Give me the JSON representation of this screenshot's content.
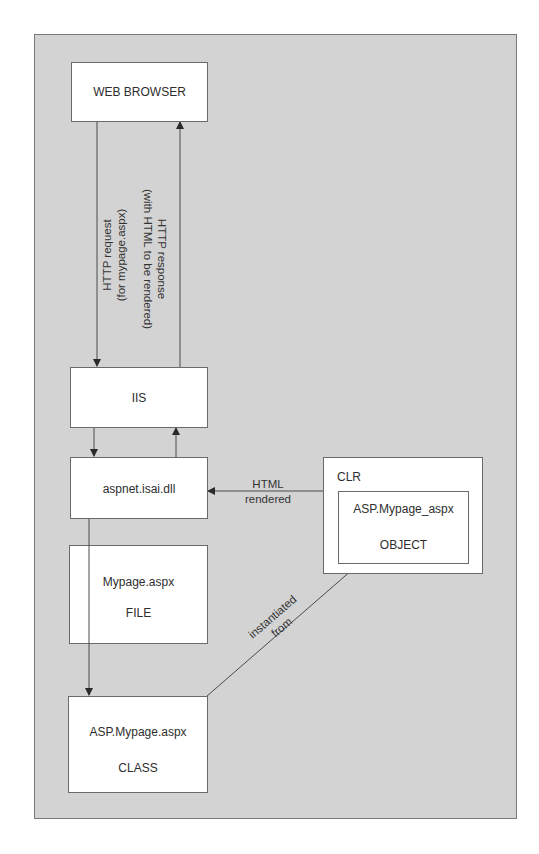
{
  "diagram": {
    "nodes": {
      "web_browser": {
        "label": "WEB BROWSER"
      },
      "iis": {
        "label": "IIS"
      },
      "aspnet_isapi": {
        "label": "aspnet.isai.dll"
      },
      "file": {
        "name": "Mypage.aspx",
        "type": "FILE"
      },
      "class": {
        "name": "ASP.Mypage.aspx",
        "type": "CLASS"
      },
      "clr": {
        "label": "CLR"
      },
      "object": {
        "name": "ASP.Mypage_aspx",
        "type": "OBJECT"
      }
    },
    "edges": {
      "http_request": {
        "line1": "HTTP request",
        "line2": "(for mypage.aspx)",
        "from": "WEB BROWSER",
        "to": "IIS"
      },
      "http_response": {
        "line1": "HTTP response",
        "line2": "(with  HTML to be rendered)",
        "from": "IIS",
        "to": "WEB BROWSER"
      },
      "iis_to_aspnet": {
        "from": "IIS",
        "to": "aspnet.isai.dll"
      },
      "aspnet_to_iis": {
        "from": "aspnet.isai.dll",
        "to": "IIS"
      },
      "html_rendered": {
        "line1": "HTML",
        "line2": "rendered",
        "from": "CLR",
        "to": "aspnet.isai.dll"
      },
      "aspnet_to_class": {
        "from": "aspnet.isai.dll",
        "to": "ASP.Mypage.aspx CLASS"
      },
      "instantiated_from": {
        "line1": "instantiated",
        "line2": "from",
        "from": "ASP.Mypage.aspx CLASS",
        "to": "ASP.Mypage_aspx OBJECT"
      }
    },
    "colors": {
      "panel_background": "#d3d3d3",
      "box_background": "#ffffff",
      "line": "#4a4a4a"
    }
  }
}
